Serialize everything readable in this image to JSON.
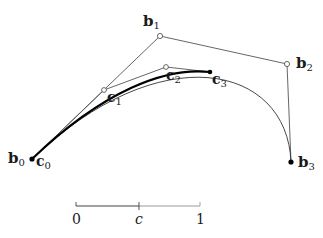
{
  "diagram": {
    "colors": {
      "background": "#ffffff",
      "polygon": "#555555",
      "curve": "#333333",
      "subcurve": "#000000",
      "scale_left": "#444444",
      "scale_right": "#999999"
    },
    "control_points_b": [
      {
        "id": "b0",
        "base": "b",
        "sub": "0",
        "x": 32,
        "y": 159,
        "marker": "filled"
      },
      {
        "id": "b1",
        "base": "b",
        "sub": "1",
        "x": 160,
        "y": 36,
        "marker": "open"
      },
      {
        "id": "b2",
        "base": "b",
        "sub": "2",
        "x": 287,
        "y": 64,
        "marker": "open"
      },
      {
        "id": "b3",
        "base": "b",
        "sub": "3",
        "x": 291,
        "y": 162,
        "marker": "filled"
      }
    ],
    "control_points_c": [
      {
        "id": "c0",
        "base": "c",
        "sub": "0",
        "x": 32,
        "y": 159,
        "marker": "filled"
      },
      {
        "id": "c1",
        "base": "c",
        "sub": "1",
        "x": 104,
        "y": 90,
        "marker": "open"
      },
      {
        "id": "c2",
        "base": "c",
        "sub": "2",
        "x": 166,
        "y": 67,
        "marker": "open"
      },
      {
        "id": "c3",
        "base": "c",
        "sub": "3",
        "x": 210,
        "y": 72,
        "marker": "filled"
      }
    ],
    "labels": {
      "b0": {
        "base": "b",
        "sub": "0"
      },
      "b1": {
        "base": "b",
        "sub": "1"
      },
      "b2": {
        "base": "b",
        "sub": "2"
      },
      "b3": {
        "base": "b",
        "sub": "3"
      },
      "c0": {
        "base": "c",
        "sub": "0"
      },
      "c1": {
        "base": "c",
        "sub": "1"
      },
      "c2": {
        "base": "c",
        "sub": "2"
      },
      "c3": {
        "base": "c",
        "sub": "3"
      }
    },
    "scale_bar": {
      "start_label": "0",
      "mid_label": "c",
      "end_label": "1",
      "x_start": 76,
      "x_mid": 139,
      "x_end": 200,
      "y": 206
    }
  }
}
